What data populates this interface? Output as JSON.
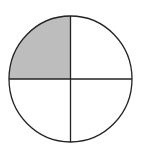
{
  "diagram": {
    "type": "fraction-circle",
    "parts_total": 4,
    "parts_shaded": 1,
    "shaded_quadrant": "top-left",
    "fraction": "1/4",
    "colors": {
      "background": "#ffffff",
      "stroke": "#222222",
      "shade": "#bdbdbd"
    }
  }
}
